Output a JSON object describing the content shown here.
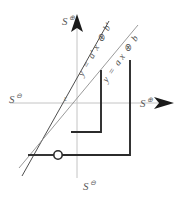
{
  "figure": {
    "background_color": "#ffffff"
  },
  "axes": {
    "origin_label": "ε",
    "axis_color": "#bfbfbf",
    "arrow_color": "#1a1a1a",
    "labels": {
      "top": {
        "base": "S",
        "sup": "⊕",
        "name": "axis-label-top"
      },
      "right": {
        "base": "S",
        "sup": "⊕",
        "name": "axis-label-right"
      },
      "left": {
        "base": "S",
        "sup": "⊖",
        "name": "axis-label-left"
      },
      "bottom": {
        "base": "S",
        "sup": "⊖",
        "name": "axis-label-bottom"
      }
    },
    "origin_px": {
      "x": 77,
      "y": 103
    }
  },
  "lines": [
    {
      "id": "line-primed",
      "label": "y = a'x ⊕ b'",
      "label_parts": {
        "lhs": "y",
        "eq": "=",
        "a": "a′",
        "x": "x",
        "oplus": "⊕",
        "b": "b′"
      },
      "color": "#3a3a3a",
      "stroke_width": 0.9,
      "slope_steep": true
    },
    {
      "id": "line-plain",
      "label": "y = ax ⊕ b",
      "label_parts": {
        "lhs": "y",
        "eq": "=",
        "a": "a",
        "x": "x",
        "oplus": "⊕",
        "b": "b"
      },
      "color": "#8a8a8a",
      "stroke_width": 0.9,
      "slope_steep": false
    }
  ],
  "staircases": [
    {
      "id": "staircase-primed",
      "color": "#2b2b2b",
      "stroke_width": 1.9,
      "description": "inner step path for y = a'x ⊕ b'"
    },
    {
      "id": "staircase-plain",
      "color": "#2b2b2b",
      "stroke_width": 1.9,
      "description": "outer step path for y = ax ⊕ b"
    }
  ],
  "marker": {
    "id": "intersection-marker",
    "shape": "open-circle",
    "fill": "#ffffff",
    "stroke": "#2b2b2b",
    "radius_px": 4.2,
    "position_px": {
      "x": 58,
      "y": 155
    }
  }
}
